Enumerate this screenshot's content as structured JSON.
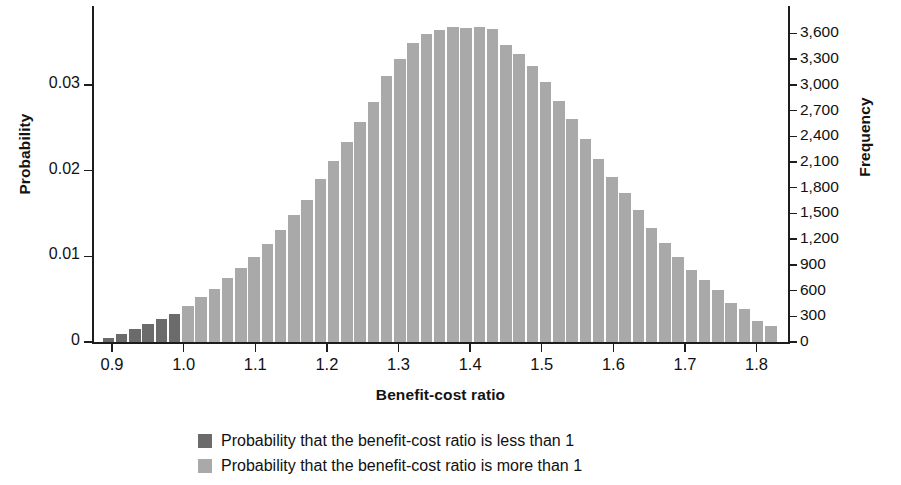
{
  "chart_data": {
    "type": "bar",
    "title": "",
    "subtitle": "",
    "xlabel": "Benefit-cost ratio",
    "ylabel": "Probability",
    "ylabel_secondary": "Frequency",
    "grid": false,
    "legend_position": "bottom",
    "xlim": [
      0.872,
      1.845
    ],
    "ylim": [
      0,
      0.0392
    ],
    "ylim_secondary": [
      0,
      3920
    ],
    "xticks": [
      "0.9",
      "1.0",
      "1.1",
      "1.2",
      "1.3",
      "1.4",
      "1.5",
      "1.6",
      "1.7",
      "1.8"
    ],
    "xtick_values": [
      0.9,
      1.0,
      1.1,
      1.2,
      1.3,
      1.4,
      1.5,
      1.6,
      1.7,
      1.8
    ],
    "yticks": [
      "0",
      "0.01",
      "0.02",
      "0.03"
    ],
    "ytick_values": [
      0,
      0.01,
      0.02,
      0.03
    ],
    "yticks_secondary": [
      "0",
      "300",
      "600",
      "900",
      "1,200",
      "1,500",
      "1,800",
      "2,100",
      "2,400",
      "2,700",
      "3,000",
      "3,300",
      "3,600"
    ],
    "ytick_values_secondary": [
      0,
      300,
      600,
      900,
      1200,
      1500,
      1800,
      2100,
      2400,
      2700,
      3000,
      3300,
      3600
    ],
    "frequency_per_probability": 100000,
    "bin_width": 0.0185,
    "threshold": 1.0,
    "colors": {
      "below_threshold": "#6b6b6b",
      "above_threshold": "#a9a9a9",
      "axis": "#1d1d1d",
      "text": "#111111",
      "background": "#ffffff"
    },
    "legend": [
      {
        "label": "Probability that the benefit-cost ratio is less than 1",
        "color": "#6b6b6b"
      },
      {
        "label": "Probability that the benefit-cost ratio is more than 1",
        "color": "#a9a9a9"
      }
    ],
    "x": [
      0.895,
      0.9135,
      0.932,
      0.9505,
      0.969,
      0.9875,
      1.006,
      1.0245,
      1.043,
      1.0615,
      1.08,
      1.0985,
      1.117,
      1.1355,
      1.154,
      1.1725,
      1.191,
      1.2095,
      1.228,
      1.2465,
      1.265,
      1.2835,
      1.302,
      1.3205,
      1.339,
      1.3575,
      1.376,
      1.3945,
      1.413,
      1.4315,
      1.45,
      1.4685,
      1.487,
      1.5055,
      1.524,
      1.5425,
      1.561,
      1.5795,
      1.598,
      1.6165,
      1.635,
      1.6535,
      1.672,
      1.6905,
      1.709,
      1.7275,
      1.746,
      1.7645,
      1.783,
      1.8015,
      1.82
    ],
    "values": [
      0.00045,
      0.0009,
      0.0015,
      0.0021,
      0.00265,
      0.0033,
      0.0042,
      0.0052,
      0.0062,
      0.00745,
      0.0086,
      0.0099,
      0.0114,
      0.0131,
      0.0148,
      0.0166,
      0.019,
      0.0211,
      0.0233,
      0.0257,
      0.028,
      0.031,
      0.033,
      0.0349,
      0.0359,
      0.0364,
      0.0368,
      0.0366,
      0.0368,
      0.0365,
      0.0346,
      0.0336,
      0.0322,
      0.0303,
      0.0281,
      0.026,
      0.0237,
      0.0213,
      0.0192,
      0.0174,
      0.0154,
      0.0133,
      0.0115,
      0.0099,
      0.0084,
      0.0072,
      0.0061,
      0.0046,
      0.0038,
      0.0025,
      0.0019
    ],
    "frequencies": [
      45,
      90,
      150,
      210,
      265,
      330,
      420,
      520,
      620,
      745,
      860,
      990,
      1140,
      1310,
      1480,
      1660,
      1900,
      2110,
      2330,
      2570,
      2800,
      3100,
      3300,
      3490,
      3590,
      3640,
      3680,
      3660,
      3680,
      3650,
      3460,
      3360,
      3220,
      3030,
      2810,
      2600,
      2370,
      2130,
      1920,
      1740,
      1540,
      1330,
      1150,
      990,
      840,
      720,
      610,
      460,
      380,
      250,
      190
    ]
  }
}
